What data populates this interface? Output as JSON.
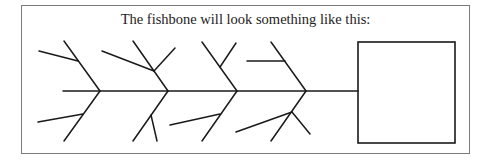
{
  "title": "The fishbone will look something like this:",
  "colors": {
    "line": "#1a1a1a",
    "frame": "#7a7a7a",
    "background": "#ffffff"
  },
  "diagram": {
    "type": "fishbone",
    "spine": {
      "x1": 63,
      "y1": 91,
      "x2": 358,
      "y2": 91
    },
    "head_box": {
      "x": 358,
      "y": 42,
      "width": 97,
      "height": 101
    },
    "bones": [
      {
        "id": "bone-1",
        "upper": {
          "x1": 64,
          "y1": 41,
          "x2": 100,
          "y2": 91
        },
        "upper_subs": [
          {
            "x1": 39,
            "y1": 51,
            "x2": 78,
            "y2": 61
          }
        ],
        "lower": {
          "x1": 100,
          "y1": 91,
          "x2": 64,
          "y2": 141
        },
        "lower_subs": [
          {
            "x1": 38,
            "y1": 122,
            "x2": 83,
            "y2": 114
          }
        ]
      },
      {
        "id": "bone-2",
        "upper": {
          "x1": 133,
          "y1": 41,
          "x2": 168,
          "y2": 91
        },
        "upper_subs": [
          {
            "x1": 102,
            "y1": 51,
            "x2": 154,
            "y2": 71
          },
          {
            "x1": 175,
            "y1": 48,
            "x2": 154,
            "y2": 71
          }
        ],
        "lower": {
          "x1": 168,
          "y1": 91,
          "x2": 133,
          "y2": 141
        },
        "lower_subs": [
          {
            "x1": 151,
            "y1": 115,
            "x2": 157,
            "y2": 141
          }
        ]
      },
      {
        "id": "bone-3",
        "upper": {
          "x1": 202,
          "y1": 42,
          "x2": 237,
          "y2": 91
        },
        "upper_subs": [
          {
            "x1": 220,
            "y1": 67,
            "x2": 236,
            "y2": 43
          }
        ],
        "lower": {
          "x1": 237,
          "y1": 91,
          "x2": 202,
          "y2": 141
        },
        "lower_subs": [
          {
            "x1": 170,
            "y1": 125,
            "x2": 220,
            "y2": 114
          }
        ]
      },
      {
        "id": "bone-4",
        "upper": {
          "x1": 271,
          "y1": 42,
          "x2": 306,
          "y2": 91
        },
        "upper_subs": [
          {
            "x1": 247,
            "y1": 61,
            "x2": 285,
            "y2": 61
          }
        ],
        "lower": {
          "x1": 306,
          "y1": 91,
          "x2": 271,
          "y2": 141
        },
        "lower_subs": [
          {
            "x1": 236,
            "y1": 132,
            "x2": 292,
            "y2": 112
          },
          {
            "x1": 292,
            "y1": 112,
            "x2": 310,
            "y2": 134
          }
        ]
      }
    ]
  }
}
